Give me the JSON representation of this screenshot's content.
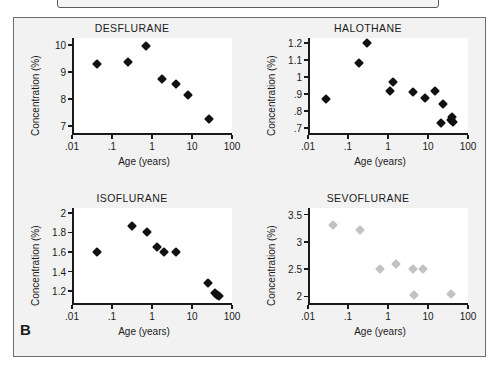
{
  "figure": {
    "panel_letter": "B",
    "background_color": "#f2f2f2",
    "plot_background_color": "#ffffff",
    "frame_color": "#6d6d6d",
    "marker_color_dark": "#111111",
    "marker_color_light": "#c2c2c2"
  },
  "chart_data": [
    {
      "type": "scatter",
      "title": "DESFLURANE",
      "xlabel": "Age (years)",
      "ylabel": "Concentration (%)",
      "xscale": "log",
      "xlim": [
        0.01,
        100
      ],
      "ylim": [
        6.75,
        10.25
      ],
      "xticks": [
        0.01,
        0.1,
        1,
        10,
        100
      ],
      "xticklabels": [
        ".01",
        ".1",
        "1",
        "10",
        "100"
      ],
      "yticks": [
        7,
        8,
        9,
        10
      ],
      "yticklabels": [
        "7",
        "8",
        "9",
        "10"
      ],
      "grid": false,
      "legend": "none",
      "marker_color": "#111111",
      "points": [
        {
          "x": 0.042,
          "y": 9.28
        },
        {
          "x": 0.25,
          "y": 9.38
        },
        {
          "x": 0.72,
          "y": 9.95
        },
        {
          "x": 1.8,
          "y": 8.73
        },
        {
          "x": 3.9,
          "y": 8.55
        },
        {
          "x": 7.8,
          "y": 8.15
        },
        {
          "x": 26.0,
          "y": 7.25
        }
      ]
    },
    {
      "type": "scatter",
      "title": "HALOTHANE",
      "xlabel": "Age (years)",
      "ylabel": "Concentration (%)",
      "xscale": "log",
      "xlim": [
        0.01,
        100
      ],
      "ylim": [
        0.67,
        1.23
      ],
      "xticks": [
        0.01,
        0.1,
        1,
        10,
        100
      ],
      "xticklabels": [
        ".01",
        ".1",
        "1",
        "10",
        "100"
      ],
      "yticks": [
        0.7,
        0.8,
        0.9,
        1.0,
        1.1,
        1.2
      ],
      "yticklabels": [
        ".7",
        ".8",
        ".9",
        "1",
        "1.1",
        "1.2"
      ],
      "grid": false,
      "legend": "none",
      "marker_color": "#111111",
      "points": [
        {
          "x": 0.029,
          "y": 0.87
        },
        {
          "x": 0.19,
          "y": 1.08
        },
        {
          "x": 0.3,
          "y": 1.2
        },
        {
          "x": 1.15,
          "y": 0.92
        },
        {
          "x": 1.35,
          "y": 0.97
        },
        {
          "x": 4.1,
          "y": 0.91
        },
        {
          "x": 8.2,
          "y": 0.875
        },
        {
          "x": 15.0,
          "y": 0.92
        },
        {
          "x": 21.0,
          "y": 0.73
        },
        {
          "x": 24.0,
          "y": 0.84
        },
        {
          "x": 38.0,
          "y": 0.745
        },
        {
          "x": 40.0,
          "y": 0.765
        },
        {
          "x": 42.0,
          "y": 0.735
        }
      ]
    },
    {
      "type": "scatter",
      "title": "ISOFLURANE",
      "xlabel": "Age (years)",
      "ylabel": "Concentration (%)",
      "xscale": "log",
      "xlim": [
        0.01,
        100
      ],
      "ylim": [
        1.08,
        2.05
      ],
      "xticks": [
        0.01,
        0.1,
        1,
        10,
        100
      ],
      "xticklabels": [
        ".01",
        ".1",
        "1",
        "10",
        "100"
      ],
      "yticks": [
        1.2,
        1.4,
        1.6,
        1.8,
        2.0
      ],
      "yticklabels": [
        "1.2",
        "1.4",
        "1.6",
        "1.8",
        "2"
      ],
      "grid": false,
      "legend": "none",
      "marker_color": "#111111",
      "points": [
        {
          "x": 0.042,
          "y": 1.6
        },
        {
          "x": 0.31,
          "y": 1.87
        },
        {
          "x": 0.75,
          "y": 1.8
        },
        {
          "x": 1.35,
          "y": 1.65
        },
        {
          "x": 2.0,
          "y": 1.6
        },
        {
          "x": 4.0,
          "y": 1.6
        },
        {
          "x": 25.0,
          "y": 1.28
        },
        {
          "x": 38.0,
          "y": 1.18
        },
        {
          "x": 42.0,
          "y": 1.16
        },
        {
          "x": 47.0,
          "y": 1.15
        }
      ]
    },
    {
      "type": "scatter",
      "title": "SEVOFLURANE",
      "xlabel": "Age (years)",
      "ylabel": "Concentration (%)",
      "xscale": "log",
      "xlim": [
        0.01,
        100
      ],
      "ylim": [
        1.88,
        3.62
      ],
      "xticks": [
        0.01,
        0.1,
        1,
        10,
        100
      ],
      "xticklabels": [
        ".01",
        ".1",
        "1",
        "10",
        "100"
      ],
      "yticks": [
        2.0,
        2.5,
        3.0,
        3.5
      ],
      "yticklabels": [
        "2",
        "2.5",
        "3",
        "3.5"
      ],
      "grid": false,
      "legend": "none",
      "marker_color": "#c2c2c2",
      "points": [
        {
          "x": 0.042,
          "y": 3.3
        },
        {
          "x": 0.2,
          "y": 3.21
        },
        {
          "x": 0.62,
          "y": 2.5
        },
        {
          "x": 1.6,
          "y": 2.6
        },
        {
          "x": 4.2,
          "y": 2.5
        },
        {
          "x": 4.4,
          "y": 2.03
        },
        {
          "x": 7.6,
          "y": 2.51
        },
        {
          "x": 38.0,
          "y": 2.05
        }
      ]
    }
  ]
}
